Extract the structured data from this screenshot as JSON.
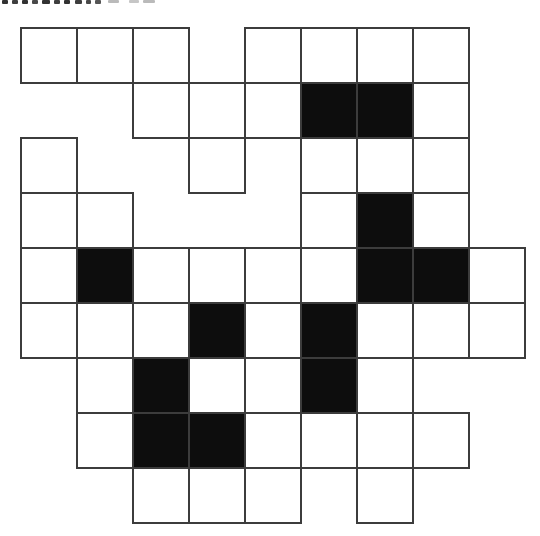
{
  "page": {
    "background_color": "#ffffff"
  },
  "clipped_text_marks": {
    "color": "#1c1c1c",
    "marks": [
      {
        "x": 2,
        "w": 6,
        "h": 4,
        "o": 0.9
      },
      {
        "x": 12,
        "w": 6,
        "h": 4,
        "o": 0.85
      },
      {
        "x": 22,
        "w": 6,
        "h": 4,
        "o": 0.9
      },
      {
        "x": 32,
        "w": 6,
        "h": 4,
        "o": 0.8
      },
      {
        "x": 42,
        "w": 8,
        "h": 4,
        "o": 0.9
      },
      {
        "x": 54,
        "w": 6,
        "h": 4,
        "o": 0.85
      },
      {
        "x": 64,
        "w": 6,
        "h": 4,
        "o": 0.9
      },
      {
        "x": 75,
        "w": 7,
        "h": 4,
        "o": 0.85
      },
      {
        "x": 86,
        "w": 5,
        "h": 4,
        "o": 0.8
      },
      {
        "x": 95,
        "w": 6,
        "h": 4,
        "o": 0.75
      },
      {
        "x": 108,
        "w": 11,
        "h": 3,
        "o": 0.3
      },
      {
        "x": 129,
        "w": 10,
        "h": 3,
        "o": 0.25
      },
      {
        "x": 143,
        "w": 12,
        "h": 3,
        "o": 0.3
      }
    ]
  },
  "grid": {
    "rows": 9,
    "cols": 9,
    "cell_width": 56,
    "cell_height": 55,
    "origin_x": 21,
    "origin_y": 28,
    "line_width": 2,
    "line_color": "#3c3c3c",
    "black_cell_color": "#0d0d0d",
    "white_cell_color": "#ffffff",
    "cell_legend": {
      "W": "empty white square",
      "B": "filled black square",
      ".": "outside puzzle shape (no cell)"
    },
    "cells": [
      "WWW.WWWW.",
      "..WWWBBW.",
      "W..W.WWW.",
      "WW...WBW.",
      "WBWWWWBBW",
      "WWWBWBWWW",
      ".WBWWBW..",
      ".WBBWWWW.",
      "..WWW.W.."
    ],
    "black_cell_count": 12,
    "white_cell_count": 46,
    "total_cell_count": 58
  }
}
